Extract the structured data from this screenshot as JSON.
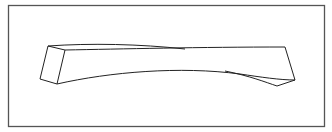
{
  "figure": {
    "colors": {
      "background": "#ffffff",
      "frame": "#555555",
      "stroke": "#222222"
    }
  }
}
